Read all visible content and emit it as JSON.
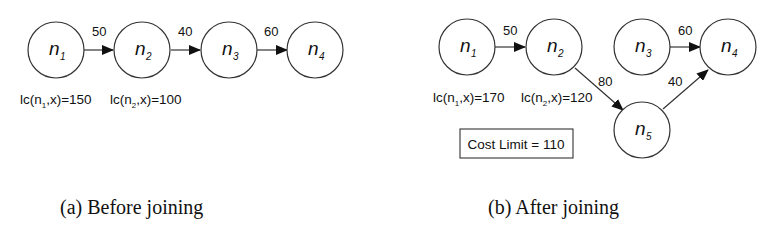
{
  "panels": [
    {
      "id": "a",
      "caption": "(a) Before joining",
      "nodes": [
        {
          "id": "n1",
          "base": "n",
          "sub": "1"
        },
        {
          "id": "n2",
          "base": "n",
          "sub": "2"
        },
        {
          "id": "n3",
          "base": "n",
          "sub": "3"
        },
        {
          "id": "n4",
          "base": "n",
          "sub": "4"
        }
      ],
      "edges": [
        {
          "from": "n1",
          "to": "n2",
          "weight": "50"
        },
        {
          "from": "n2",
          "to": "n3",
          "weight": "40"
        },
        {
          "from": "n3",
          "to": "n4",
          "weight": "60"
        }
      ],
      "annotations": [
        {
          "node": "n1",
          "prefix": "lc(n",
          "sub": "1",
          "suffix": ",x)=150"
        },
        {
          "node": "n2",
          "prefix": "lc(n",
          "sub": "2",
          "suffix": ",x)=100"
        }
      ]
    },
    {
      "id": "b",
      "caption": "(b) After joining",
      "nodes": [
        {
          "id": "n1",
          "base": "n",
          "sub": "1"
        },
        {
          "id": "n2",
          "base": "n",
          "sub": "2"
        },
        {
          "id": "n3",
          "base": "n",
          "sub": "3"
        },
        {
          "id": "n4",
          "base": "n",
          "sub": "4"
        },
        {
          "id": "n5",
          "base": "n",
          "sub": "5"
        }
      ],
      "edges": [
        {
          "from": "n1",
          "to": "n2",
          "weight": "50"
        },
        {
          "from": "n3",
          "to": "n4",
          "weight": "60"
        },
        {
          "from": "n2",
          "to": "n5",
          "weight": "80"
        },
        {
          "from": "n5",
          "to": "n4",
          "weight": "40"
        }
      ],
      "annotations": [
        {
          "node": "n1",
          "prefix": "lc(n",
          "sub": "1",
          "suffix": ",x)=170"
        },
        {
          "node": "n2",
          "prefix": "lc(n",
          "sub": "2",
          "suffix": ",x)=120"
        }
      ],
      "cost_limit_box": "Cost Limit = 110"
    }
  ]
}
